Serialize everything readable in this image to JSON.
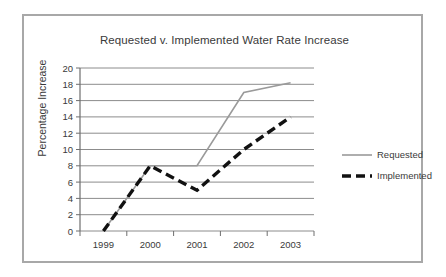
{
  "chart_data": {
    "type": "line",
    "title": "Requested v. Implemented Water Rate Increase",
    "xlabel": "",
    "ylabel": "Percentage Increase",
    "categories": [
      "1999",
      "2000",
      "2001",
      "2002",
      "2003"
    ],
    "ylim": [
      0,
      20
    ],
    "ytick_step": 2,
    "yticks": [
      "20",
      "18",
      "16",
      "14",
      "12",
      "10",
      "8",
      "6",
      "4",
      "2",
      "0"
    ],
    "grid": "horizontal",
    "legend_position": "right",
    "series": [
      {
        "name": "Requested",
        "color": "#9a9a9a",
        "style": "solid",
        "values": [
          0,
          8,
          8,
          17,
          18.2
        ]
      },
      {
        "name": "Implemented",
        "color": "#111111",
        "style": "dashed",
        "values": [
          0,
          8,
          5,
          10,
          14
        ]
      }
    ]
  },
  "legend": {
    "items": [
      {
        "label": "Requested"
      },
      {
        "label": "Implemented"
      }
    ]
  }
}
